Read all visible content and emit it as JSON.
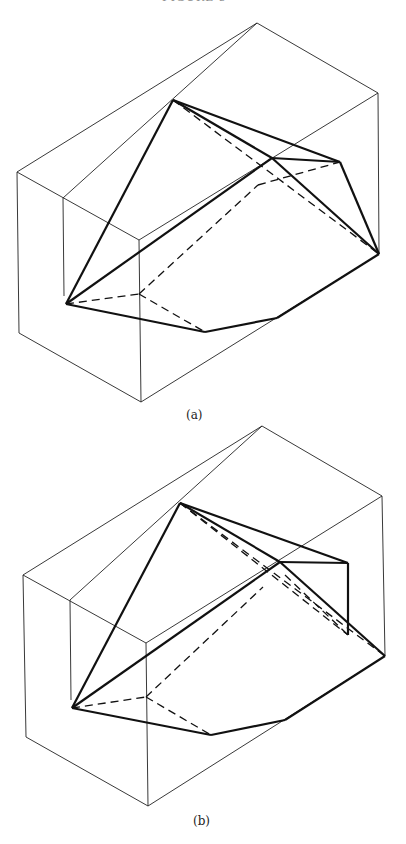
{
  "header": {
    "text": "FIGURE 5"
  },
  "figures": [
    {
      "id": "a",
      "caption": "(a)",
      "box": {
        "top": [
          257,
          23
        ],
        "right_top": [
          378,
          93
        ],
        "left_top": [
          17,
          172
        ],
        "inner_top": [
          63,
          198
        ],
        "front_top": [
          139,
          240
        ],
        "left_bottom": [
          19,
          333
        ],
        "bottom": [
          141,
          402
        ],
        "right_bottom": [
          379,
          254
        ],
        "inner_bottom": [
          64,
          296
        ]
      },
      "solid_edges": [
        [
          [
            173,
            100
          ],
          [
            66,
            304
          ]
        ],
        [
          [
            173,
            100
          ],
          [
            272,
            158
          ]
        ],
        [
          [
            173,
            100
          ],
          [
            340,
            162
          ]
        ],
        [
          [
            66,
            304
          ],
          [
            272,
            158
          ]
        ],
        [
          [
            272,
            158
          ],
          [
            340,
            162
          ]
        ],
        [
          [
            272,
            158
          ],
          [
            379,
            254
          ]
        ],
        [
          [
            340,
            162
          ],
          [
            379,
            254
          ]
        ],
        [
          [
            66,
            304
          ],
          [
            205,
            332
          ]
        ],
        [
          [
            205,
            332
          ],
          [
            277,
            318
          ]
        ],
        [
          [
            277,
            318
          ],
          [
            379,
            254
          ]
        ]
      ],
      "dashed_edges": [
        [
          [
            173,
            100
          ],
          [
            379,
            254
          ]
        ],
        [
          [
            66,
            304
          ],
          [
            139,
            294
          ]
        ],
        [
          [
            139,
            294
          ],
          [
            205,
            332
          ]
        ],
        [
          [
            139,
            294
          ],
          [
            258,
            185
          ]
        ],
        [
          [
            258,
            185
          ],
          [
            340,
            162
          ]
        ]
      ]
    },
    {
      "id": "b",
      "caption": "(b)",
      "box": {
        "top": [
          262,
          426
        ],
        "right_top": [
          382,
          496
        ],
        "left_top": [
          23,
          575
        ],
        "inner_top": [
          70,
          600
        ],
        "front_top": [
          146,
          643
        ],
        "left_bottom": [
          26,
          737
        ],
        "bottom": [
          148,
          806
        ],
        "right_bottom": [
          385,
          656
        ],
        "inner_bottom": [
          71,
          700
        ]
      },
      "solid_edges": [
        [
          [
            180,
            503
          ],
          [
            72,
            708
          ]
        ],
        [
          [
            180,
            503
          ],
          [
            348,
            563
          ]
        ],
        [
          [
            180,
            503
          ],
          [
            280,
            562
          ]
        ],
        [
          [
            72,
            708
          ],
          [
            280,
            562
          ]
        ],
        [
          [
            280,
            562
          ],
          [
            348,
            563
          ]
        ],
        [
          [
            348,
            563
          ],
          [
            348,
            635
          ]
        ],
        [
          [
            280,
            562
          ],
          [
            385,
            656
          ]
        ],
        [
          [
            72,
            708
          ],
          [
            211,
            735
          ]
        ],
        [
          [
            211,
            735
          ],
          [
            285,
            720
          ]
        ],
        [
          [
            285,
            720
          ],
          [
            385,
            656
          ]
        ]
      ],
      "dashed_edges": [
        [
          [
            180,
            503
          ],
          [
            385,
            656
          ]
        ],
        [
          [
            180,
            503
          ],
          [
            348,
            635
          ]
        ],
        [
          [
            285,
            575
          ],
          [
            348,
            635
          ]
        ],
        [
          [
            72,
            708
          ],
          [
            146,
            697
          ]
        ],
        [
          [
            146,
            697
          ],
          [
            211,
            735
          ]
        ],
        [
          [
            146,
            697
          ],
          [
            263,
            587
          ]
        ]
      ]
    }
  ]
}
